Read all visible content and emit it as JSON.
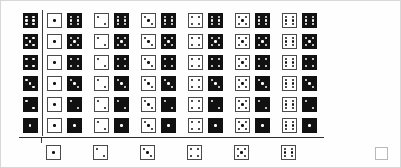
{
  "table": {
    "type": "dice-operation-table",
    "row_header_color": "#111111",
    "column_header_color": "#ffffff",
    "rule_color": "#2e2e2e",
    "row_headers": [
      6,
      5,
      4,
      3,
      2,
      1
    ],
    "column_headers": [
      1,
      2,
      3,
      4,
      5,
      6
    ],
    "rows": [
      {
        "header": 6,
        "cells": [
          {
            "operand": 1,
            "result": 6
          },
          {
            "operand": 2,
            "result": 6
          },
          {
            "operand": 3,
            "result": 6
          },
          {
            "operand": 4,
            "result": 6
          },
          {
            "operand": 5,
            "result": 6
          },
          {
            "operand": 6,
            "result": 6
          }
        ]
      },
      {
        "header": 5,
        "cells": [
          {
            "operand": 1,
            "result": 5
          },
          {
            "operand": 2,
            "result": 5
          },
          {
            "operand": 3,
            "result": 5
          },
          {
            "operand": 4,
            "result": 5
          },
          {
            "operand": 5,
            "result": 5
          },
          {
            "operand": 6,
            "result": 5
          }
        ]
      },
      {
        "header": 4,
        "cells": [
          {
            "operand": 1,
            "result": 4
          },
          {
            "operand": 2,
            "result": 4
          },
          {
            "operand": 3,
            "result": 4
          },
          {
            "operand": 4,
            "result": 4
          },
          {
            "operand": 5,
            "result": 4
          },
          {
            "operand": 6,
            "result": 4
          }
        ]
      },
      {
        "header": 3,
        "cells": [
          {
            "operand": 1,
            "result": 3
          },
          {
            "operand": 2,
            "result": 3
          },
          {
            "operand": 3,
            "result": 3
          },
          {
            "operand": 4,
            "result": 3
          },
          {
            "operand": 5,
            "result": 3
          },
          {
            "operand": 6,
            "result": 3
          }
        ]
      },
      {
        "header": 2,
        "cells": [
          {
            "operand": 1,
            "result": 2
          },
          {
            "operand": 2,
            "result": 2
          },
          {
            "operand": 3,
            "result": 2
          },
          {
            "operand": 4,
            "result": 2
          },
          {
            "operand": 5,
            "result": 2
          },
          {
            "operand": 6,
            "result": 2
          }
        ]
      },
      {
        "header": 1,
        "cells": [
          {
            "operand": 1,
            "result": 1
          },
          {
            "operand": 2,
            "result": 1
          },
          {
            "operand": 3,
            "result": 1
          },
          {
            "operand": 4,
            "result": 1
          },
          {
            "operand": 5,
            "result": 1
          },
          {
            "operand": 6,
            "result": 1
          }
        ]
      }
    ],
    "footer_dice": [
      1,
      2,
      3,
      4,
      5,
      6
    ],
    "empty_square": ""
  }
}
